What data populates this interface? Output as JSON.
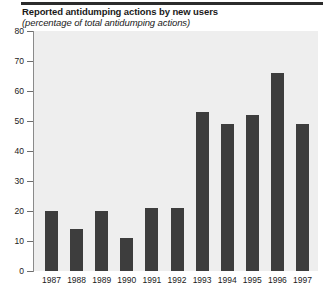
{
  "chart_data": {
    "type": "bar",
    "title": "Reported antidumping actions by new users",
    "subtitle": "(percentage of total antidumping actions)",
    "xlabel": "",
    "ylabel": "",
    "categories": [
      "1987",
      "1988",
      "1989",
      "1990",
      "1991",
      "1992",
      "1993",
      "1994",
      "1995",
      "1996",
      "1997"
    ],
    "values": [
      20,
      14,
      20,
      11,
      21,
      21,
      53,
      49,
      52,
      66,
      49
    ],
    "ylim": [
      0,
      80
    ],
    "yticks": [
      0,
      10,
      20,
      30,
      40,
      50,
      60,
      70,
      80
    ],
    "ytick_labels": [
      "0",
      "10",
      "20",
      "30",
      "40",
      "50",
      "60",
      "70",
      "80"
    ],
    "grid": false,
    "legend": null,
    "bar_color": "#3d3d3d",
    "plot_background": "#eeeeee"
  }
}
